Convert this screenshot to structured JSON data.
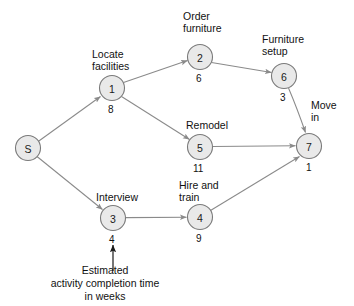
{
  "diagram": {
    "type": "project-network-diagram",
    "background": "#ffffff",
    "node_fill": "#e9e9e9",
    "node_stroke": "#7a7a7a",
    "edge_color": "#8a8a8a",
    "text_color": "#111111",
    "nodes": [
      {
        "id": "S",
        "label": "S",
        "cx": 28,
        "cy": 148,
        "r": 12.5,
        "activity": "",
        "duration": ""
      },
      {
        "id": "1",
        "label": "1",
        "cx": 112,
        "cy": 88,
        "r": 12.5,
        "activity": "Locate\nfacilities",
        "duration": "8"
      },
      {
        "id": "2",
        "label": "2",
        "cx": 200,
        "cy": 57,
        "r": 12.5,
        "activity": "Order\nfurniture",
        "duration": "6"
      },
      {
        "id": "6",
        "label": "6",
        "cx": 284,
        "cy": 76,
        "r": 12.5,
        "activity": "Furniture\nsetup",
        "duration": "3"
      },
      {
        "id": "5",
        "label": "5",
        "cx": 200,
        "cy": 147,
        "r": 12.5,
        "activity": "Remodel",
        "duration": "11"
      },
      {
        "id": "7",
        "label": "7",
        "cx": 309,
        "cy": 146,
        "r": 12.5,
        "activity": "Move\nin",
        "duration": "1"
      },
      {
        "id": "3",
        "label": "3",
        "cx": 113,
        "cy": 218,
        "r": 12.5,
        "activity": "Interview",
        "duration": "4"
      },
      {
        "id": "4",
        "label": "4",
        "cx": 200,
        "cy": 217,
        "r": 12.5,
        "activity": "Hire and\ntrain",
        "duration": "9"
      }
    ],
    "edges": [
      {
        "from": "S",
        "to": "1"
      },
      {
        "from": "S",
        "to": "3"
      },
      {
        "from": "1",
        "to": "2"
      },
      {
        "from": "1",
        "to": "5"
      },
      {
        "from": "2",
        "to": "6"
      },
      {
        "from": "6",
        "to": "7"
      },
      {
        "from": "5",
        "to": "7"
      },
      {
        "from": "3",
        "to": "4"
      },
      {
        "from": "4",
        "to": "7"
      }
    ],
    "activity_labels": {
      "locate_facilities_line1": "Locate",
      "locate_facilities_line2": "facilities",
      "order_furniture_line1": "Order",
      "order_furniture_line2": "furniture",
      "furniture_setup_line1": "Furniture",
      "furniture_setup_line2": "setup",
      "remodel": "Remodel",
      "move_in_line1": "Move",
      "move_in_line2": "in",
      "interview": "Interview",
      "hire_and_train_line1": "Hire and",
      "hire_and_train_line2": "train"
    },
    "durations": {
      "n1": "8",
      "n2": "6",
      "n6": "3",
      "n5": "11",
      "n7": "1",
      "n3": "4",
      "n4": "9"
    },
    "node_ids": {
      "s": "S",
      "n1": "1",
      "n2": "2",
      "n3": "3",
      "n4": "4",
      "n5": "5",
      "n6": "6",
      "n7": "7"
    },
    "caption": {
      "line1": "Estimated",
      "line2": "activity completion time",
      "line3": "in weeks",
      "points_to": "4"
    }
  }
}
